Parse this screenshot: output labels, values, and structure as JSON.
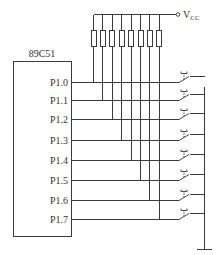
{
  "diagram": {
    "chip": {
      "label": "89C51"
    },
    "supply": {
      "label": "V",
      "subscript": "CC"
    },
    "pins": [
      {
        "label": "P1.0",
        "y": 82
      },
      {
        "label": "P1.1",
        "y": 100
      },
      {
        "label": "P1.2",
        "y": 119
      },
      {
        "label": "P1.3",
        "y": 140
      },
      {
        "label": "P1.4",
        "y": 160
      },
      {
        "label": "P1.5",
        "y": 180
      },
      {
        "label": "P1.6",
        "y": 200
      },
      {
        "label": "P1.7",
        "y": 219
      }
    ],
    "resistor_count": 8,
    "switch_count": 8,
    "components": {
      "pull_up_resistors": "8 resistors tied to VCC",
      "switches": "8 push-button switches to ground",
      "ground": "ground symbol"
    }
  }
}
